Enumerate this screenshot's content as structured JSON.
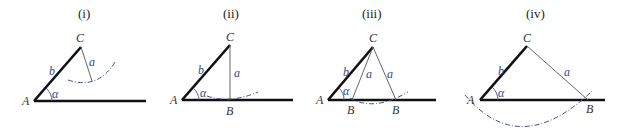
{
  "figure": {
    "panels": [
      {
        "caption": "(i)",
        "case": "no triangle",
        "labels": {
          "A": "A",
          "C": "C",
          "b": "b",
          "a": "a",
          "alpha": "α"
        }
      },
      {
        "caption": "(ii)",
        "case": "one right triangle",
        "labels": {
          "A": "A",
          "B": "B",
          "C": "C",
          "b": "b",
          "a": "a",
          "alpha": "α"
        }
      },
      {
        "caption": "(iii)",
        "case": "two triangles",
        "labels": {
          "A": "A",
          "B1": "B",
          "B2": "B",
          "C": "C",
          "b": "b",
          "a1": "a",
          "a2": "a",
          "alpha": "α"
        }
      },
      {
        "caption": "(iv)",
        "case": "one triangle",
        "labels": {
          "A": "A",
          "B": "B",
          "C": "C",
          "b": "b",
          "a": "a",
          "alpha": "α"
        }
      }
    ],
    "colors": {
      "thick_line": "#111111",
      "thin_line": "#555555",
      "arc": "#3b4f9a",
      "label_blue": "#3a4a8a"
    }
  }
}
